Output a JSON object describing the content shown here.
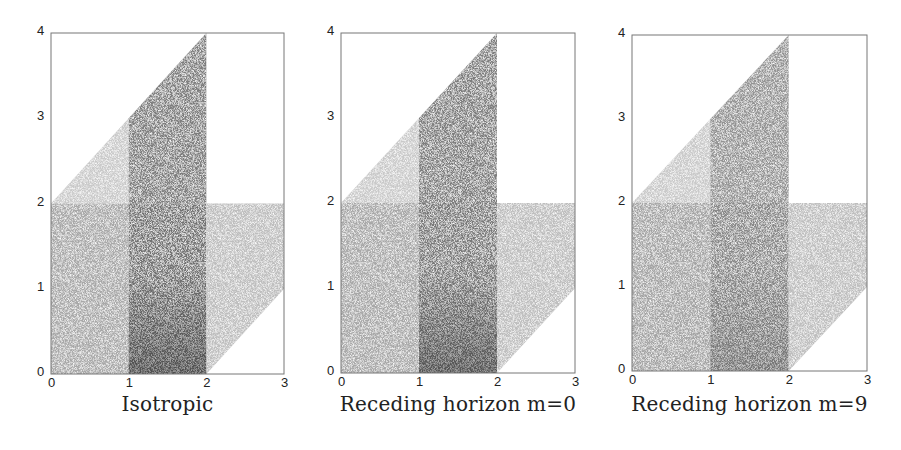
{
  "figure": {
    "panels": [
      {
        "caption": "Isotropic",
        "left": 51,
        "top": 33,
        "right": 284,
        "bottom": 374
      },
      {
        "caption": "Receding horizon m=0",
        "left": 341,
        "top": 33,
        "right": 575,
        "bottom": 373
      },
      {
        "caption": "Receding horizon m=9",
        "left": 632,
        "top": 35,
        "right": 867,
        "bottom": 371
      }
    ],
    "x_ticks": [
      "0",
      "1",
      "2",
      "3"
    ],
    "y_ticks": [
      "0",
      "1",
      "2",
      "3",
      "4"
    ]
  },
  "chart_data": [
    {
      "type": "heatmap",
      "title": "Isotropic",
      "xlabel": "",
      "ylabel": "",
      "xlim": [
        0,
        3
      ],
      "ylim": [
        0,
        4
      ],
      "x_ticks": [
        0,
        1,
        2,
        3
      ],
      "y_ticks": [
        0,
        1,
        2,
        3,
        4
      ],
      "grid": false,
      "description": "Stippled density plot over domain bounded by y<=x+2, y>=x-2, x<=2 for y>2; darkest near x in [1,2], y near 0; diagonal streak from (1,0) toward (2,1)",
      "regions": [
        {
          "name": "upper-left triangle",
          "polygon": [
            [
              0,
              2
            ],
            [
              1,
              3
            ],
            [
              1,
              2
            ]
          ],
          "shade": 0.25
        },
        {
          "name": "upper-middle",
          "polygon": [
            [
              1,
              2
            ],
            [
              1,
              3
            ],
            [
              2,
              4
            ],
            [
              2,
              2
            ]
          ],
          "shade": 0.6
        },
        {
          "name": "lower-left",
          "polygon": [
            [
              0,
              0
            ],
            [
              1,
              0
            ],
            [
              1,
              2
            ],
            [
              0,
              2
            ]
          ],
          "shade": 0.4
        },
        {
          "name": "lower-middle",
          "polygon": [
            [
              1,
              0
            ],
            [
              2,
              0
            ],
            [
              2,
              2
            ],
            [
              1,
              2
            ]
          ],
          "shade": 0.65
        },
        {
          "name": "lower-right",
          "polygon": [
            [
              2,
              0
            ],
            [
              3,
              1
            ],
            [
              3,
              2
            ],
            [
              2,
              2
            ]
          ],
          "shade": 0.3
        }
      ]
    },
    {
      "type": "heatmap",
      "title": "Receding horizon m=0",
      "xlabel": "",
      "ylabel": "",
      "xlim": [
        0,
        3
      ],
      "ylim": [
        0,
        4
      ],
      "x_ticks": [
        0,
        1,
        2,
        3
      ],
      "y_ticks": [
        0,
        1,
        2,
        3,
        4
      ],
      "grid": false,
      "regions": [
        {
          "name": "upper-left triangle",
          "polygon": [
            [
              0,
              2
            ],
            [
              1,
              3
            ],
            [
              1,
              2
            ]
          ],
          "shade": 0.25
        },
        {
          "name": "upper-middle",
          "polygon": [
            [
              1,
              2
            ],
            [
              1,
              3
            ],
            [
              2,
              4
            ],
            [
              2,
              2
            ]
          ],
          "shade": 0.6
        },
        {
          "name": "lower-left",
          "polygon": [
            [
              0,
              0
            ],
            [
              1,
              0
            ],
            [
              1,
              2
            ],
            [
              0,
              2
            ]
          ],
          "shade": 0.4
        },
        {
          "name": "lower-middle",
          "polygon": [
            [
              1,
              0
            ],
            [
              2,
              0
            ],
            [
              2,
              2
            ],
            [
              1,
              2
            ]
          ],
          "shade": 0.62
        },
        {
          "name": "lower-right",
          "polygon": [
            [
              2,
              0
            ],
            [
              3,
              1
            ],
            [
              3,
              2
            ],
            [
              2,
              2
            ]
          ],
          "shade": 0.3
        }
      ]
    },
    {
      "type": "heatmap",
      "title": "Receding horizon m=9",
      "xlabel": "",
      "ylabel": "",
      "xlim": [
        0,
        3
      ],
      "ylim": [
        0,
        4
      ],
      "x_ticks": [
        0,
        1,
        2,
        3
      ],
      "y_ticks": [
        0,
        1,
        2,
        3,
        4
      ],
      "grid": false,
      "regions": [
        {
          "name": "upper-left triangle",
          "polygon": [
            [
              0,
              2
            ],
            [
              1,
              3
            ],
            [
              1,
              2
            ]
          ],
          "shade": 0.25
        },
        {
          "name": "upper-middle",
          "polygon": [
            [
              1,
              2
            ],
            [
              1,
              3
            ],
            [
              2,
              4
            ],
            [
              2,
              2
            ]
          ],
          "shade": 0.5
        },
        {
          "name": "lower-left",
          "polygon": [
            [
              0,
              0
            ],
            [
              1,
              0
            ],
            [
              1,
              2
            ],
            [
              0,
              2
            ]
          ],
          "shade": 0.42
        },
        {
          "name": "lower-middle",
          "polygon": [
            [
              1,
              0
            ],
            [
              2,
              0
            ],
            [
              2,
              2
            ],
            [
              1,
              2
            ]
          ],
          "shade": 0.55
        },
        {
          "name": "lower-right",
          "polygon": [
            [
              2,
              0
            ],
            [
              3,
              1
            ],
            [
              3,
              2
            ],
            [
              2,
              2
            ]
          ],
          "shade": 0.3
        }
      ]
    }
  ]
}
